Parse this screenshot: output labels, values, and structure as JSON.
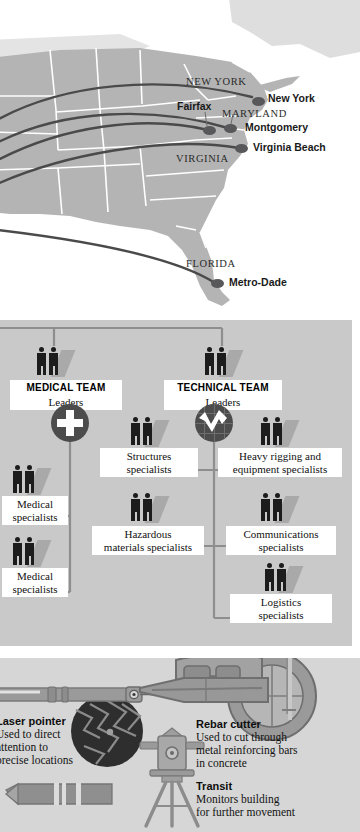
{
  "map": {
    "state_labels": [
      {
        "name": "NEW YORK",
        "x": 186,
        "y": 76
      },
      {
        "name": "MARYLAND",
        "x": 222,
        "y": 108
      },
      {
        "name": "VIRGINIA",
        "x": 176,
        "y": 153
      },
      {
        "name": "FLORIDA",
        "x": 186,
        "y": 258
      }
    ],
    "cities": [
      {
        "name": "New York",
        "dot_x": 252,
        "dot_y": 97,
        "label_x": 268,
        "label_y": 92
      },
      {
        "name": "Fairfax",
        "dot_x": 208,
        "dot_y": 130,
        "label_x": 177,
        "label_y": 106
      },
      {
        "name": "Montgomery",
        "dot_x": 228,
        "dot_y": 128,
        "label_x": 245,
        "label_y": 124
      },
      {
        "name": "Virginia Beach",
        "dot_x": 239,
        "dot_y": 148,
        "label_x": 253,
        "label_y": 143
      },
      {
        "name": "Metro-Dade",
        "dot_x": 215,
        "dot_y": 283,
        "label_x": 229,
        "label_y": 278
      }
    ],
    "colors": {
      "land": "#b4b4b4",
      "land_faint": "#dedede",
      "border": "#ffffff",
      "arc": "#4a4a4a",
      "dot": "#58585a"
    }
  },
  "org": {
    "teams": [
      {
        "name": "MEDICAL TEAM",
        "role": "Leaders",
        "box_x": 10,
        "box_y": 60,
        "box_w": 112,
        "people_x": 34,
        "badge": "medical-cross"
      },
      {
        "name": "TECHNICAL TEAM",
        "role": "Leaders",
        "box_x": 164,
        "box_y": 60,
        "box_w": 118,
        "people_x": 194,
        "badge": "technical-gauge"
      }
    ],
    "nodes": [
      {
        "label": "Medical\nspecialists",
        "line1": "Medical",
        "line2": "specialists",
        "box_x": 2,
        "box_y": 176,
        "box_w": 66,
        "people_x": 10,
        "people_y": 142
      },
      {
        "label": "Medical\nspecialists",
        "line1": "Medical",
        "line2": "specialists",
        "box_x": 2,
        "box_y": 248,
        "box_w": 66,
        "people_x": 10,
        "people_y": 214
      },
      {
        "label": "Structures\nspecialists",
        "line1": "Structures",
        "line2": "specialists",
        "box_x": 100,
        "box_y": 128,
        "box_w": 98,
        "people_x": 128,
        "people_y": 94
      },
      {
        "label": "Hazardous\nmaterials specialists",
        "line1": "Hazardous",
        "line2": "materials specialists",
        "box_x": 92,
        "box_y": 206,
        "box_w": 112,
        "people_x": 128,
        "people_y": 170
      },
      {
        "label": "Heavy rigging and\nequipment specialists",
        "line1": "Heavy rigging and",
        "line2": "equipment specialists",
        "box_x": 218,
        "box_y": 128,
        "box_w": 124,
        "people_x": 258,
        "people_y": 94
      },
      {
        "label": "Communications\nspecialists",
        "line1": "Communications",
        "line2": "specialists",
        "box_x": 226,
        "box_y": 206,
        "box_w": 110,
        "people_x": 258,
        "people_y": 170
      },
      {
        "label": "Logistics\nspecialists",
        "line1": "Logistics",
        "line2": "specialists",
        "box_x": 230,
        "box_y": 274,
        "box_w": 102,
        "people_x": 262,
        "people_y": 240
      }
    ],
    "colors": {
      "background": "#c9c9c9",
      "box": "#ffffff",
      "figure": "#1c1c1c",
      "shadow": "#a9a9a9",
      "connector": "#8e8e8e",
      "badge": "#4c4c4c"
    }
  },
  "tools": [
    {
      "name": "Laser pointer",
      "description": "Used to direct\nattention to\nprecise locations",
      "desc_lines": [
        "Used to direct",
        "attention to",
        "precise locations"
      ],
      "title_x": -4,
      "title_y": 60,
      "icon": "laser-pointer"
    },
    {
      "name": "Rebar cutter",
      "description": "Used to cut through\nmetal reinforcing bars\nin concrete",
      "desc_lines": [
        "Used to cut through",
        "metal reinforcing bars",
        "in concrete"
      ],
      "title_x": 196,
      "title_y": 62,
      "icon": "rebar-cutter"
    },
    {
      "name": "Transit",
      "description": "Monitors building\nfor further movement",
      "desc_lines": [
        "Monitors building",
        "for further movement"
      ],
      "title_x": 196,
      "title_y": 124,
      "icon": "transit"
    }
  ],
  "tool_colors": {
    "background": "#d6d6d6",
    "body": "#9a9a9a",
    "outline": "#7b7b7b",
    "dark": "#3a3a3a",
    "light": "#c2c2c2"
  }
}
